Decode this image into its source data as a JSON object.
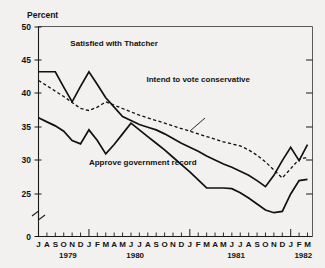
{
  "chart_data": {
    "type": "line",
    "title": "",
    "xlabel": "",
    "ylabel": "Percent",
    "ylim": [
      0,
      50
    ],
    "y_ticks": [
      0,
      25,
      30,
      35,
      40,
      45,
      50
    ],
    "y_axis_break": true,
    "y_axis_break_note": "axis broken between 0 and 25",
    "grid": false,
    "legend_position": "inline-annotations",
    "x": [
      "J 1979",
      "A 1979",
      "S 1979",
      "O 1979",
      "N 1979",
      "D 1979",
      "J 1980",
      "F 1980",
      "M 1980",
      "A 1980",
      "M 1980",
      "J 1980",
      "J 1980",
      "A 1980",
      "S 1980",
      "O 1980",
      "N 1980",
      "D 1980",
      "J 1981",
      "F 1981",
      "M 1981",
      "A 1981",
      "M 1981",
      "J 1981",
      "J 1981",
      "A 1981",
      "S 1981",
      "O 1981",
      "N 1981",
      "D 1981",
      "J 1982",
      "F 1982",
      "M 1982"
    ],
    "x_month_labels": [
      "J",
      "A",
      "S",
      "O",
      "N",
      "D",
      "J",
      "F",
      "M",
      "A",
      "M",
      "J",
      "J",
      "A",
      "S",
      "O",
      "N",
      "D",
      "J",
      "F",
      "M",
      "A",
      "M",
      "J",
      "J",
      "A",
      "S",
      "O",
      "N",
      "D",
      "J",
      "F",
      "M"
    ],
    "x_year_labels": [
      {
        "label": "1979",
        "index": 3
      },
      {
        "label": "1980",
        "index": 11
      },
      {
        "label": "1981",
        "index": 23
      },
      {
        "label": "1982",
        "index": 31
      }
    ],
    "series": [
      {
        "name": "Satisfied with Thatcher",
        "style": "solid",
        "label_x_index": 9,
        "label_y_value": 47.2,
        "values": [
          43.3,
          43.3,
          43.3,
          41.0,
          38.8,
          41.1,
          43.3,
          41.4,
          39.4,
          38.0,
          36.6,
          36.0,
          35.4,
          35.0,
          34.6,
          34.0,
          33.3,
          32.6,
          32.0,
          31.4,
          30.7,
          30.1,
          29.5,
          29.0,
          28.4,
          27.8,
          27.0,
          26.1,
          27.8,
          30.0,
          32.0,
          30.0,
          32.4
        ]
      },
      {
        "name": "Intend to vote conservative",
        "style": "dashed",
        "label_x_index": 19,
        "label_y_value": 41.8,
        "values": [
          42.0,
          41.2,
          40.4,
          39.6,
          38.7,
          37.8,
          37.5,
          38.0,
          38.8,
          38.3,
          37.8,
          37.3,
          36.8,
          36.4,
          36.0,
          35.6,
          35.2,
          34.8,
          34.4,
          34.0,
          33.6,
          33.2,
          32.8,
          32.5,
          32.2,
          31.6,
          30.8,
          29.8,
          28.6,
          27.4,
          28.8,
          30.2,
          30.5
        ]
      },
      {
        "name": "Approve government record",
        "style": "solid",
        "label_x_index": 6,
        "label_y_value": 29.4,
        "values": [
          36.4,
          35.8,
          35.2,
          34.4,
          33.0,
          32.5,
          34.6,
          33.0,
          31.0,
          32.4,
          34.0,
          35.6,
          34.6,
          33.6,
          32.6,
          31.6,
          30.5,
          29.4,
          28.3,
          27.1,
          25.9,
          25.9,
          25.9,
          25.8,
          25.2,
          24.4,
          23.5,
          22.6,
          22.2,
          22.4,
          25.0,
          27.0,
          27.2
        ]
      }
    ]
  },
  "axis": {
    "y_title": "Percent",
    "zero_label": "0"
  }
}
